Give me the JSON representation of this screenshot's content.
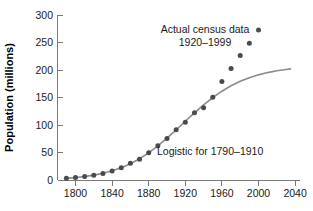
{
  "chart_data": {
    "type": "scatter",
    "title": "",
    "xlabel": "",
    "ylabel": "Population (millions)",
    "xlim": [
      1785,
      2045
    ],
    "ylim": [
      0,
      300
    ],
    "xticks": [
      1800,
      1840,
      1880,
      1920,
      1960,
      2000,
      2040
    ],
    "xtick_labels": [
      "1800",
      "1840",
      "1880",
      "1920",
      "1960",
      "2000",
      "2040"
    ],
    "yticks": [
      0,
      50,
      100,
      150,
      200,
      250,
      300
    ],
    "ytick_labels": [
      "0",
      "50",
      "100",
      "150",
      "200",
      "250",
      "300"
    ],
    "grid": false,
    "legend": "none",
    "series": [
      {
        "name": "Actual census data",
        "type": "scatter",
        "marker": "filled-circle",
        "color": "#4a4a4a",
        "x": [
          1790,
          1800,
          1810,
          1820,
          1830,
          1840,
          1850,
          1860,
          1870,
          1880,
          1890,
          1900,
          1910,
          1920,
          1930,
          1940,
          1950,
          1960,
          1970,
          1980,
          1990,
          2000
        ],
        "y": [
          3.9,
          5.3,
          7.2,
          9.6,
          12.9,
          17.1,
          23.2,
          31.4,
          38.6,
          50.2,
          62.9,
          76.0,
          92.0,
          105.7,
          122.8,
          131.7,
          150.7,
          179.3,
          203.2,
          226.5,
          248.7,
          272.7
        ]
      },
      {
        "name": "Logistic for 1790-1910",
        "type": "line",
        "color": "#8c8c8c",
        "x": [
          1790,
          1800,
          1810,
          1820,
          1830,
          1840,
          1850,
          1860,
          1870,
          1880,
          1890,
          1900,
          1910,
          1920,
          1930,
          1940,
          1950,
          1960,
          1970,
          1980,
          1990,
          2000,
          2010,
          2020,
          2030,
          2035
        ],
        "y": [
          3.9,
          5.3,
          7.2,
          9.7,
          13.1,
          17.5,
          23.2,
          30.4,
          39.4,
          50.2,
          62.8,
          76.9,
          91.9,
          107.4,
          122.7,
          137.2,
          150.4,
          161.9,
          171.7,
          179.8,
          186.3,
          191.5,
          195.6,
          198.8,
          201.3,
          202.3
        ]
      }
    ],
    "annotations": [
      {
        "text_line1": "Actual census data",
        "text_line2": "1920–1999",
        "x": 1933,
        "y": 272
      },
      {
        "text": "Logistic for 1790–1910",
        "x": 1924,
        "y": 47
      }
    ]
  },
  "colors": {
    "point": "#4a4a4a",
    "curve": "#8c8c8c",
    "axis": "#7a7a7a",
    "text": "#1a1a1a",
    "background": "#ffffff"
  }
}
